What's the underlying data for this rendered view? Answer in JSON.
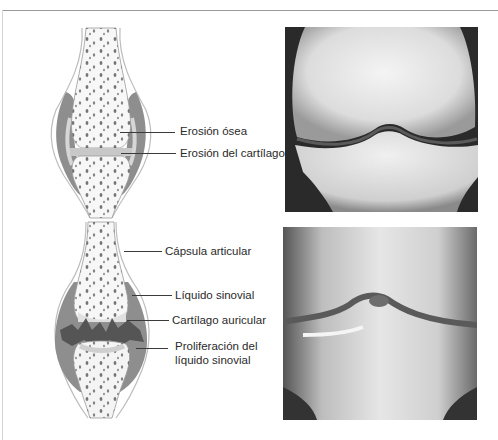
{
  "figure": {
    "top_panel": {
      "name": "early-stage joint",
      "labels": [
        {
          "text": "Erosión ósea"
        },
        {
          "text": "Erosión del cartílago"
        }
      ]
    },
    "bottom_panel": {
      "name": "advanced-stage joint",
      "labels": [
        {
          "text": "Cápsula articular"
        },
        {
          "text": "Líquido sinovial"
        },
        {
          "text": "Cartílago auricular"
        },
        {
          "text": "Proliferación del"
        },
        {
          "text": "líquido sinovial"
        }
      ]
    },
    "xrays": [
      {
        "name": "knee-xray-top"
      },
      {
        "name": "knee-xray-bottom"
      }
    ],
    "colors": {
      "frame_line": "#9a9a9a",
      "bone_fill": "#f7f7f7",
      "synovium_gray": "#8e8e8e",
      "cartilage_gray": "#c8c8c8",
      "pannus_dark": "#555555",
      "text": "#2a2a2a"
    }
  }
}
